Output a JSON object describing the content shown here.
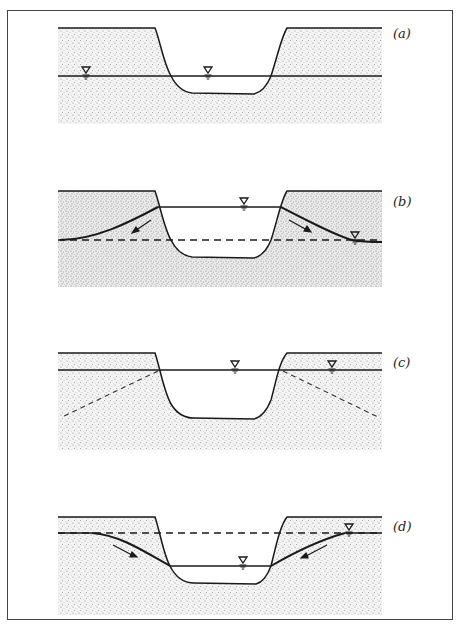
{
  "figure": {
    "colors": {
      "line": "#1a1a1a",
      "stipple": "#bdbdbd",
      "frame": "#444444",
      "background": "#ffffff"
    },
    "panels": [
      {
        "id": "a",
        "label": "(a)",
        "water_table_symbols": 2,
        "groundwater_flow_arrows": 0,
        "dashed_lines": "none"
      },
      {
        "id": "b",
        "label": "(b)",
        "water_table_symbols": 2,
        "groundwater_flow_arrows": 2,
        "arrow_direction": "away-from-channel",
        "dashed_lines": "original-water-table"
      },
      {
        "id": "c",
        "label": "(c)",
        "water_table_symbols": 2,
        "groundwater_flow_arrows": 0,
        "dashed_lines": "diverging-slopes"
      },
      {
        "id": "d",
        "label": "(d)",
        "water_table_symbols": 2,
        "groundwater_flow_arrows": 2,
        "arrow_direction": "toward-channel",
        "dashed_lines": "original-water-table"
      }
    ]
  }
}
